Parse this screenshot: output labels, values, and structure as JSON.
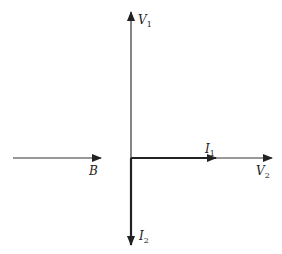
{
  "diagram": {
    "type": "phasor-diagram",
    "labels": {
      "V1": {
        "main": "V",
        "sub": "1"
      },
      "V2": {
        "main": "V",
        "sub": "2"
      },
      "I1": {
        "main": "I",
        "sub": "1"
      },
      "I2": {
        "main": "I",
        "sub": "2"
      },
      "B": {
        "main": "B",
        "sub": ""
      }
    },
    "colors": {
      "stroke": "#222222",
      "background": "#ffffff"
    }
  }
}
